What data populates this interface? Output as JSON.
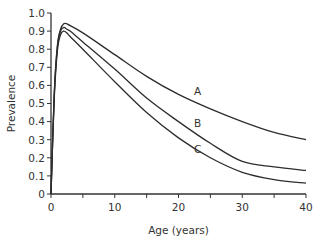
{
  "chart_data": {
    "type": "line",
    "title": "",
    "xlabel": "Age (years)",
    "ylabel": "Prevalence",
    "xlim": [
      0,
      40
    ],
    "ylim": [
      0,
      1.0
    ],
    "x_ticks": [
      "0",
      "10",
      "20",
      "30",
      "40"
    ],
    "y_ticks": [
      "0",
      "0.1",
      "0.2",
      "0.3",
      "0.4",
      "0.5",
      "0.6",
      "0.7",
      "0.8",
      "0.9",
      "1.0"
    ],
    "grid": false,
    "legend": "inline curve labels",
    "x": [
      0,
      0.5,
      1,
      1.5,
      2,
      2.5,
      3,
      5,
      10,
      15,
      20,
      25,
      30,
      35,
      40
    ],
    "series": [
      {
        "name": "A",
        "values": [
          0,
          0.55,
          0.82,
          0.91,
          0.94,
          0.94,
          0.93,
          0.89,
          0.77,
          0.65,
          0.55,
          0.47,
          0.4,
          0.34,
          0.3
        ]
      },
      {
        "name": "B",
        "values": [
          0,
          0.54,
          0.81,
          0.9,
          0.92,
          0.91,
          0.9,
          0.84,
          0.69,
          0.53,
          0.4,
          0.28,
          0.18,
          0.15,
          0.13
        ]
      },
      {
        "name": "C",
        "values": [
          0,
          0.52,
          0.79,
          0.88,
          0.9,
          0.89,
          0.87,
          0.8,
          0.62,
          0.45,
          0.31,
          0.2,
          0.12,
          0.08,
          0.06
        ]
      }
    ],
    "annotations": [
      {
        "text": "A",
        "x": 23.0,
        "y": 0.57
      },
      {
        "text": "B",
        "x": 23.0,
        "y": 0.39
      },
      {
        "text": "C",
        "x": 23.0,
        "y": 0.25
      }
    ]
  }
}
